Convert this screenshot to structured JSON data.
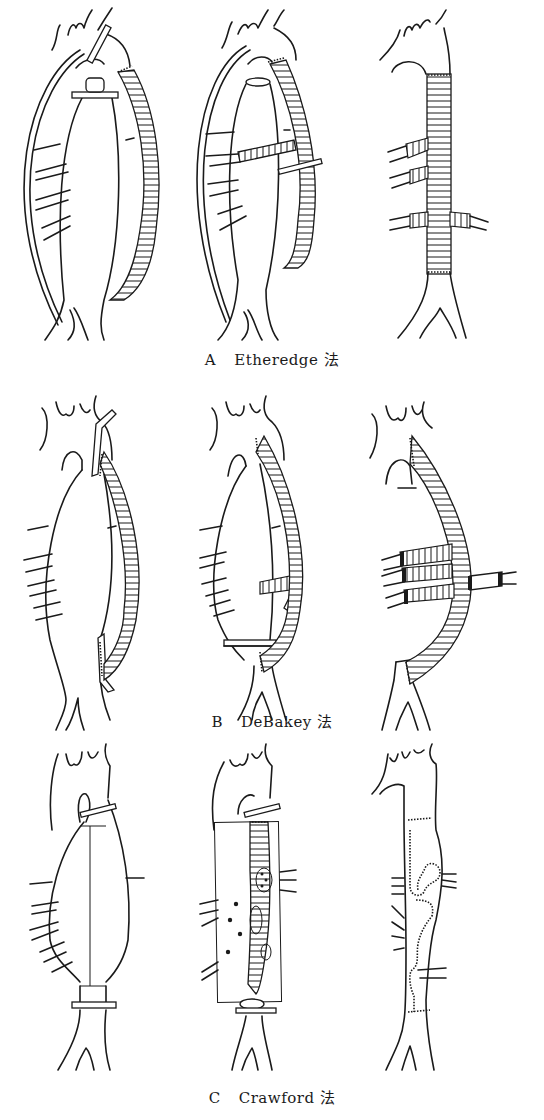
{
  "figure": {
    "panels": [
      {
        "letter": "A",
        "method": "Etheredge 法",
        "stages": [
          "clamp-and-shunt",
          "side-branch-reimplantation",
          "completed-graft"
        ]
      },
      {
        "letter": "B",
        "method": "DeBakey 法",
        "stages": [
          "bypass-graft-proximal",
          "side-branch-anastomosis",
          "completed-bypass"
        ]
      },
      {
        "letter": "C",
        "method": "Crawford 法",
        "stages": [
          "aneurysm-clamped",
          "inclusion-graft",
          "completed-repair"
        ]
      }
    ],
    "colors": {
      "ink": "#1a1a1a",
      "background": "#ffffff"
    }
  }
}
